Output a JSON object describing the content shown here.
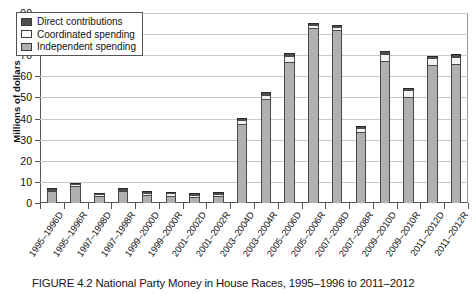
{
  "figure": {
    "caption": "FIGURE 4.2  National Party Money in House Races, 1995–1996 to 2011–2012"
  },
  "legend": {
    "position": "top-left",
    "items": [
      {
        "label": "Direct contributions",
        "color": "#4f4f4f",
        "icon": "legend-swatch-icon"
      },
      {
        "label": "Coordinated spending",
        "color": "#fbfbfb",
        "icon": "legend-swatch-icon"
      },
      {
        "label": "Independent spending",
        "color": "#b0b0b0",
        "icon": "legend-swatch-icon"
      }
    ]
  },
  "axes": {
    "y_title": "Millions of dollars",
    "y_ticks": [
      "0",
      "10",
      "20",
      "30",
      "40",
      "50",
      "60",
      "70",
      "80",
      "90"
    ]
  },
  "chart_data": {
    "type": "bar",
    "stacked": true,
    "title": "National Party Money in House Races, 1995–1996 to 2011–2012",
    "xlabel": "",
    "ylabel": "Millions of dollars",
    "ylim": [
      0,
      90
    ],
    "ytick_step": 10,
    "grid": true,
    "legend_position": "top-left",
    "categories": [
      "1995–1996D",
      "1995–1996R",
      "1997–1998D",
      "1997–1998R",
      "1999–2000D",
      "1999–2000R",
      "2001–2002D",
      "2001–2002R",
      "2003–2004D",
      "2003–2004R",
      "2005–2006D",
      "2005–2006R",
      "2007–2008D",
      "2007–2008R",
      "2009–2010D",
      "2009–2010R",
      "2011–2012D",
      "2011–2012R"
    ],
    "series": [
      {
        "name": "Independent spending",
        "color": "#b0b0b0",
        "values": [
          5.6,
          8.0,
          3.3,
          5.6,
          3.6,
          3.4,
          2.7,
          3.3,
          37.5,
          49.5,
          67.0,
          83.0,
          82.0,
          33.5,
          67.5,
          50.0,
          65.5,
          66.0
        ]
      },
      {
        "name": "Coordinated spending",
        "color": "#fbfbfb",
        "values": [
          0.7,
          0.9,
          0.5,
          0.6,
          1.2,
          1.3,
          1.1,
          1.0,
          2.0,
          1.8,
          2.7,
          1.3,
          1.3,
          2.0,
          3.0,
          3.4,
          3.0,
          3.3
        ]
      },
      {
        "name": "Direct contributions",
        "color": "#4f4f4f",
        "values": [
          0.5,
          0.6,
          0.4,
          0.5,
          0.6,
          0.7,
          0.6,
          0.7,
          1.0,
          1.2,
          1.3,
          1.2,
          1.2,
          1.0,
          1.3,
          1.2,
          1.3,
          1.4
        ]
      }
    ],
    "totals": [
      6.8,
      9.5,
      4.2,
      6.7,
      5.4,
      5.4,
      4.4,
      5.0,
      40.5,
      52.5,
      71.0,
      85.5,
      84.5,
      36.5,
      71.8,
      54.6,
      69.8,
      70.7
    ]
  }
}
